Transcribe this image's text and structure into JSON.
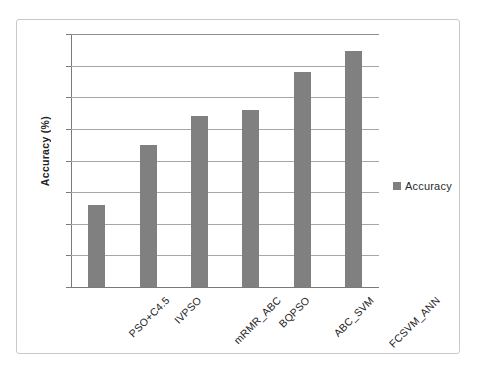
{
  "chart_data": {
    "type": "bar",
    "title": "",
    "subtitle": "",
    "xlabel": "",
    "ylabel": "Accuracy (%)",
    "categories": [
      "PSO+C4.5",
      "IVPSO",
      "mRMR_ABC",
      "BQPSO",
      "ABC_SVM",
      "FCSVM_ANN"
    ],
    "values": [
      90.6,
      92.5,
      93.4,
      93.6,
      94.8,
      95.45
    ],
    "series": [
      {
        "name": "Accuracy",
        "values": [
          90.6,
          92.5,
          93.4,
          93.6,
          94.8,
          95.45
        ]
      }
    ],
    "ylim": [
      88,
      96
    ],
    "y_ticks": [
      88,
      89,
      90,
      91,
      92,
      93,
      94,
      95,
      96
    ],
    "y_tick_labels": [
      "88",
      "89",
      "90",
      "91",
      "92",
      "93",
      "94",
      "95",
      "96"
    ],
    "grid": true,
    "grid_axis": "y",
    "legend": {
      "position": "right",
      "entries": [
        "Accuracy"
      ]
    },
    "colors": {
      "bar": "#808080",
      "gridline": "#a6a6a6",
      "axis": "#7a7a7a",
      "text": "#232323",
      "frame": "#c9c9c9",
      "background": "#ffffff"
    },
    "x_tick_label_rotation": -45
  }
}
